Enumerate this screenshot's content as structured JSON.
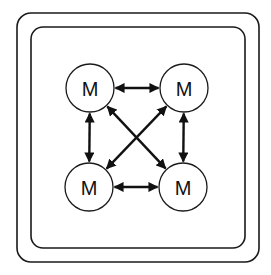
{
  "diagram": {
    "frames": [
      {
        "name": "outer-frame",
        "x": 17,
        "y": 13,
        "w": 242,
        "h": 249,
        "r": 14
      },
      {
        "name": "inner-frame",
        "x": 31,
        "y": 27,
        "w": 214,
        "h": 221,
        "r": 12
      }
    ],
    "nodes": [
      {
        "id": "tl",
        "label": "M",
        "cx": 90,
        "cy": 88,
        "r": 24
      },
      {
        "id": "tr",
        "label": "M",
        "cx": 184,
        "cy": 88,
        "r": 24
      },
      {
        "id": "bl",
        "label": "M",
        "cx": 89,
        "cy": 187,
        "r": 24
      },
      {
        "id": "br",
        "label": "M",
        "cx": 183,
        "cy": 187,
        "r": 24
      }
    ],
    "edges": [
      {
        "from": "tl",
        "to": "tr",
        "bidirectional": true
      },
      {
        "from": "bl",
        "to": "br",
        "bidirectional": true
      },
      {
        "from": "tl",
        "to": "bl",
        "bidirectional": true
      },
      {
        "from": "tr",
        "to": "br",
        "bidirectional": true
      },
      {
        "from": "tl",
        "to": "br",
        "bidirectional": true
      },
      {
        "from": "tr",
        "to": "bl",
        "bidirectional": true
      }
    ],
    "colors": {
      "stroke": "#111111",
      "background": "#ffffff"
    }
  }
}
